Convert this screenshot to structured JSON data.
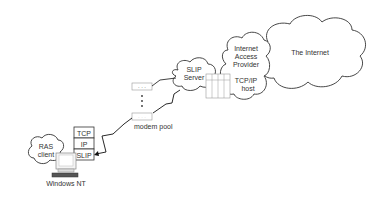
{
  "diagram": {
    "rasClient": {
      "line1": "RAS",
      "line2": "client"
    },
    "stack": {
      "tcp": "TCP",
      "ip": "IP",
      "slip": "SLIP"
    },
    "computer": {
      "label": "Windows NT"
    },
    "modemPool": {
      "label": "modem pool",
      "dots": "· · ·",
      "vdots": "⋮"
    },
    "slipServer": {
      "line1": "SLIP",
      "line2": "Server"
    },
    "provider": {
      "line1": "Internet",
      "line2": "Access",
      "line3": "Provider",
      "line4": "TCP/IP",
      "line5": "host"
    },
    "internet": {
      "label": "The Internet"
    }
  }
}
